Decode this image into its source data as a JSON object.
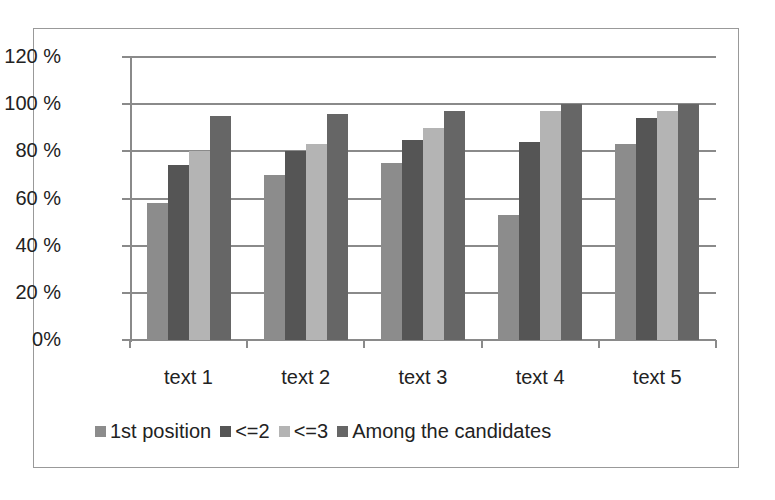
{
  "chart_data": {
    "type": "bar",
    "title": "",
    "xlabel": "",
    "ylabel": "",
    "categories": [
      "text 1",
      "text 2",
      "text 3",
      "text 4",
      "text 5"
    ],
    "series": [
      {
        "name": "1st position",
        "color": "#8c8c8c",
        "values": [
          58,
          70,
          75,
          53,
          83
        ]
      },
      {
        "name": "<=2",
        "color": "#555555",
        "values": [
          74,
          80,
          85,
          84,
          94
        ]
      },
      {
        "name": "<=3",
        "color": "#b4b4b4",
        "values": [
          80,
          83,
          90,
          97,
          97
        ]
      },
      {
        "name": "Among the candidates",
        "color": "#666666",
        "values": [
          95,
          96,
          97,
          100,
          100
        ]
      }
    ],
    "ylim": [
      0,
      120
    ],
    "yticks": [
      "0%",
      "20 %",
      "40 %",
      "60 %",
      "80 %",
      "100 %",
      "120 %"
    ],
    "grid": true,
    "legend_position": "bottom"
  }
}
